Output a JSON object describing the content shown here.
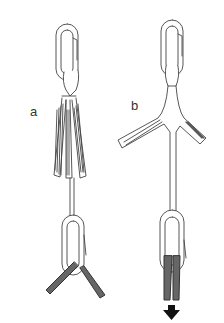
{
  "figure": {
    "panels": [
      {
        "id": "a",
        "label": "a",
        "description": "Carabiner with two separate sling strands to a lower carabiner, rope spread apart"
      },
      {
        "id": "b",
        "label": "b",
        "description": "Carabiner with sling branching in Y shape, lower carabiner with rope pulled straight down"
      }
    ],
    "arrow": {
      "direction": "down",
      "meaning": "load-direction"
    },
    "colors": {
      "line": "#444444",
      "fill": "#ffffff",
      "rope": "#333333",
      "arrow": "#111111"
    }
  }
}
